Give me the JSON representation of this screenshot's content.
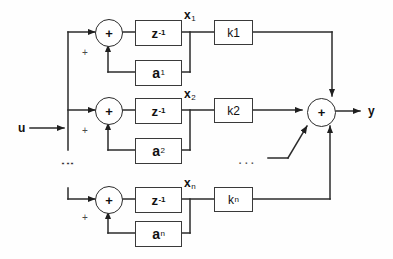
{
  "diagram": {
    "input": {
      "label": "u"
    },
    "output": {
      "label": "y"
    },
    "summer_symbol": "+",
    "sign_marks": [
      "+",
      "+",
      "+"
    ],
    "vertical_ellipsis": "⋮",
    "horizontal_ellipsis": "...",
    "colors": {
      "background": "#fefefe",
      "line": "#2b2b2b",
      "block_border": "#3a3a3a",
      "text": "#111111",
      "sign_mark": "#4a4a4a"
    },
    "rows": [
      {
        "index": 1,
        "delay_base": "z",
        "delay_exp": "-1",
        "state_base": "x",
        "state_sub": "1",
        "gain_label": "k1",
        "gain_base": "k",
        "gain_sub": "1",
        "feedback_base": "a",
        "feedback_sub": "1",
        "sign": "+"
      },
      {
        "index": 2,
        "delay_base": "z",
        "delay_exp": "-1",
        "state_base": "x",
        "state_sub": "2",
        "gain_label": "k2",
        "gain_base": "k",
        "gain_sub": "2",
        "feedback_base": "a",
        "feedback_sub": "2",
        "sign": "+"
      },
      {
        "index": 3,
        "delay_base": "z",
        "delay_exp": "-1",
        "state_base": "x",
        "state_sub": "n",
        "gain_label": "kn",
        "gain_base": "k",
        "gain_sub": "n",
        "feedback_base": "a",
        "feedback_sub": "n",
        "sign": "+"
      }
    ]
  }
}
